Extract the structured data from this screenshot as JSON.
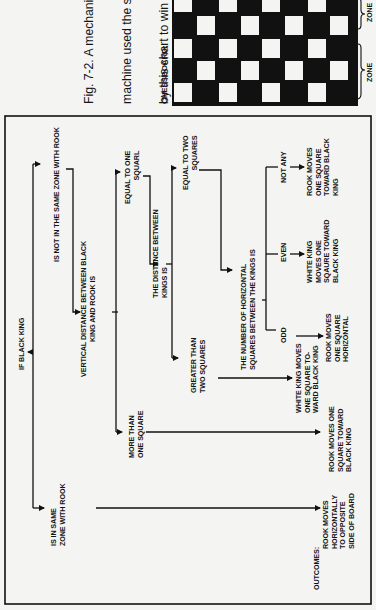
{
  "figure": {
    "caption_lines": [
      "Fig. 7-2. A mechanical",
      "machine used the sta",
      "by this chart to win",
      "game. The machine",
      "White King and Ro",
      "human opponent pos",
      "only."
    ],
    "chessboard_label": "CHESSBOARD:",
    "zone_labels": [
      "ZONE",
      "ZONE"
    ],
    "orientation": "rotated 90° clockwise"
  },
  "flowchart": {
    "root": "IF BLACK KING",
    "branch_same_zone": "IS IN SAME\nZONE WITH ROOK",
    "branch_not_same_zone": "IS NOT IN THE SAME ZONE WITH ROOK",
    "vertical_distance": "VERTICAL DISTANCE BETWEEN BLACK\nKING AND ROOK IS",
    "more_than_one": "MORE THAN\nONE SQUARE",
    "equal_to_one": "EQUAL TO ONE\nSQUARL",
    "kings_distance": "THE DISTANCE BETWEEN\nKINGS IS",
    "greater_than_two": "GREATER THAN\nTWO SQUARES",
    "equal_to_two": "EQUAL TO TWO\nSQUARES",
    "horizontal_count": "THE NUMBER OF HORIZONTAL\nSQUARES BETWEEN THE KINGS IS",
    "odd": "ODD",
    "even": "EVEN",
    "not_any": "NOT ANY",
    "outcomes_label": "OUTCOMES:",
    "outcomes": [
      "ROOK MOVES\nHORIZONTALLY\nTO OPPOSITE\nSIDE OF BOARD",
      "ROOK MOVES ONE\nSQUARE TOWARD\nBLACK KING",
      "WHITE KING MOVES\nONE SQUARE TO-\nWARD BLACK KING",
      "ROOK MOVES\nONE SQUARE\nHORIZONTAL",
      "WHITE KING\nMOVES ONE\nSQAURE TOWARD\nBLACK KING",
      "ROOK MOVES\nONE SQUARE\nTOWARD BLACK\nKING"
    ]
  },
  "colors": {
    "ink": "#111111",
    "paper": "#f4f4f2"
  }
}
